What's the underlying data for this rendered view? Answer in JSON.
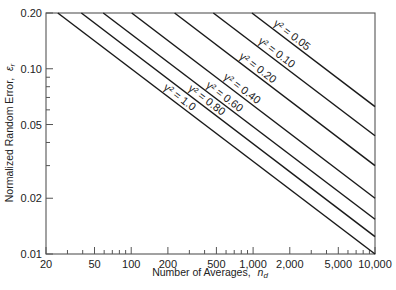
{
  "chart_data": {
    "type": "line",
    "title": "",
    "xlabel": "Number of Averages, n_d",
    "xlabel_main": "Number of Averages,",
    "xlabel_symbol": "n",
    "xlabel_sub": "d",
    "ylabel": "Normalized Random Error, ε_r",
    "ylabel_main": "Normalized Random Error,",
    "ylabel_symbol": "ε",
    "ylabel_sub": "r",
    "xscale": "log",
    "yscale": "log",
    "xlim": [
      20,
      10000
    ],
    "ylim": [
      0.01,
      0.2
    ],
    "grid": false,
    "legend": "inline labels along curves",
    "x_ticks": [
      {
        "value": 20,
        "label": "20"
      },
      {
        "value": 50,
        "label": "50"
      },
      {
        "value": 100,
        "label": "100"
      },
      {
        "value": 200,
        "label": "200"
      },
      {
        "value": 500,
        "label": "500"
      },
      {
        "value": 1000,
        "label": "1,000"
      },
      {
        "value": 2000,
        "label": "2,000"
      },
      {
        "value": 5000,
        "label": "5,000"
      },
      {
        "value": 10000,
        "label": "10,000"
      }
    ],
    "x_minor_ticks": [
      30,
      40,
      60,
      70,
      80,
      90,
      300,
      400,
      600,
      700,
      800,
      900,
      3000,
      4000,
      6000,
      7000,
      8000,
      9000
    ],
    "y_ticks": [
      {
        "value": 0.2,
        "label": "0.20"
      },
      {
        "value": 0.1,
        "label": "0.10"
      },
      {
        "value": 0.05,
        "label": "0.05"
      },
      {
        "value": 0.02,
        "label": "0.02"
      },
      {
        "value": 0.01,
        "label": "0.01"
      }
    ],
    "y_minor_ticks": [
      0.09,
      0.08,
      0.07,
      0.06,
      0.04,
      0.03
    ],
    "series": [
      {
        "name": "γ² = 0.05",
        "gamma2": 0.05,
        "label": "γ² = 0.05",
        "x": [
          978,
          10000
        ],
        "y": [
          0.2,
          0.0625
        ]
      },
      {
        "name": "γ² = 0.10",
        "gamma2": 0.1,
        "label": "γ² = 0.10",
        "x": [
          472,
          10000
        ],
        "y": [
          0.2,
          0.0435
        ]
      },
      {
        "name": "γ² = 0.20",
        "gamma2": 0.2,
        "label": "γ² = 0.20",
        "x": [
          227,
          10000
        ],
        "y": [
          0.2,
          0.03
        ]
      },
      {
        "name": "γ² = 0.40",
        "gamma2": 0.4,
        "label": "γ² = 0.40",
        "x": [
          101,
          10000
        ],
        "y": [
          0.2,
          0.02
        ]
      },
      {
        "name": "γ² = 0.60",
        "gamma2": 0.6,
        "label": "γ² = 0.60",
        "x": [
          59,
          10000
        ],
        "y": [
          0.2,
          0.0154
        ]
      },
      {
        "name": "γ² = 0.80",
        "gamma2": 0.8,
        "label": "γ² = 0.80",
        "x": [
          39,
          10000
        ],
        "y": [
          0.2,
          0.0124
        ]
      },
      {
        "name": "γ² = 1.0",
        "gamma2": 1.0,
        "label": "γ² = 1.0",
        "x": [
          25,
          10000
        ],
        "y": [
          0.2,
          0.01
        ]
      }
    ],
    "label_positions": [
      {
        "series": 0,
        "x": 2000,
        "anchor_y_offset": -4
      },
      {
        "series": 1,
        "x": 1500,
        "anchor_y_offset": -4
      },
      {
        "series": 2,
        "x": 1050,
        "anchor_y_offset": -4
      },
      {
        "series": 3,
        "x": 780,
        "anchor_y_offset": -4
      },
      {
        "series": 4,
        "x": 560,
        "anchor_y_offset": -4
      },
      {
        "series": 5,
        "x": 400,
        "anchor_y_offset": -4
      },
      {
        "series": 6,
        "x": 240,
        "anchor_y_offset": -4
      }
    ]
  },
  "colors": {
    "axis": "#555555",
    "line": "#1a1a1a",
    "text": "#222222"
  }
}
